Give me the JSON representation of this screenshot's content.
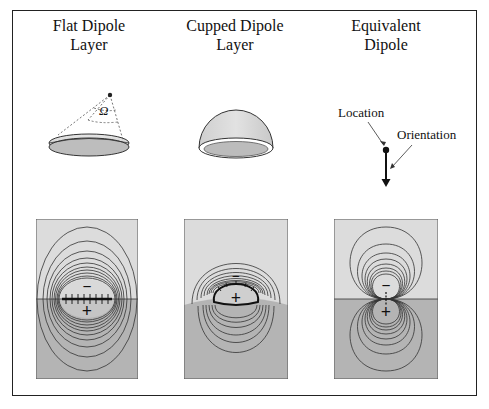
{
  "columns": [
    {
      "title_line1": "Flat Dipole",
      "title_line2": "Layer",
      "omega_label": "Ω"
    },
    {
      "title_line1": "Cupped Dipole",
      "title_line2": "Layer"
    },
    {
      "title_line1": "Equivalent",
      "title_line2": "Dipole",
      "location_label": "Location",
      "orientation_label": "Orientation"
    }
  ],
  "panels": [
    {
      "minus": "−",
      "plus": "+"
    },
    {
      "minus": "−",
      "plus": "+"
    },
    {
      "minus": "−",
      "plus": "+"
    }
  ],
  "colors": {
    "upper_region": "#dcdcdc",
    "lower_region": "#b4b4b4",
    "contour": "#333333",
    "frame": "#222222"
  }
}
